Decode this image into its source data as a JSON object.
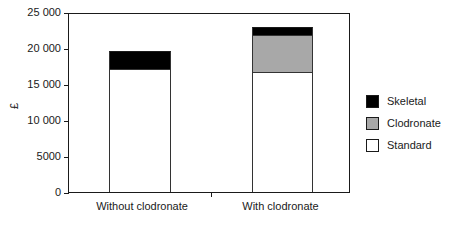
{
  "chart_data": {
    "type": "bar",
    "subtype": "stacked",
    "title": "",
    "xlabel": "",
    "ylabel": "£",
    "categories": [
      "Without clodronate",
      "With clodronate"
    ],
    "series": [
      {
        "name": "Standard",
        "color": "#ffffff",
        "values": [
          16900,
          16550
        ]
      },
      {
        "name": "Clodronate",
        "color": "#a8a8a8",
        "values": [
          0,
          5100
        ]
      },
      {
        "name": "Skeletal",
        "color": "#000000",
        "values": [
          2650,
          1250
        ]
      }
    ],
    "totals": [
      19550,
      22900
    ],
    "ylim": [
      0,
      25000
    ],
    "ytick_values": [
      0,
      5000,
      10000,
      15000,
      20000,
      25000
    ],
    "ytick_labels": [
      "0",
      "5000",
      "10 000",
      "15 000",
      "20 000",
      "25 000"
    ],
    "grid": false,
    "legend_position": "right",
    "legend_order": [
      "Skeletal",
      "Clodronate",
      "Standard"
    ]
  },
  "axis": {
    "y_title": "£",
    "ticks": [
      {
        "label": "25 000",
        "value": 25000
      },
      {
        "label": "20 000",
        "value": 20000
      },
      {
        "label": "15 000",
        "value": 15000
      },
      {
        "label": "10 000",
        "value": 10000
      },
      {
        "label": "5000",
        "value": 5000
      },
      {
        "label": "0",
        "value": 0
      }
    ],
    "categories": [
      {
        "label": "Without clodronate"
      },
      {
        "label": "With clodronate"
      }
    ]
  },
  "legend": {
    "items": [
      {
        "label": "Skeletal",
        "color": "#000000"
      },
      {
        "label": "Clodronate",
        "color": "#a8a8a8"
      },
      {
        "label": "Standard",
        "color": "#ffffff"
      }
    ]
  }
}
